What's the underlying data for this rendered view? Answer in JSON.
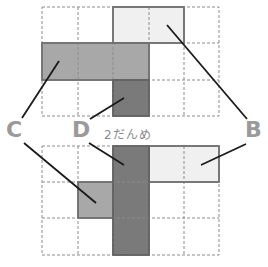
{
  "diagram": {
    "type": "grid-block-stacking-puzzle",
    "grid": {
      "columns": 5,
      "rows": 3
    },
    "colors": {
      "B": "#f0f0f0",
      "C": "#a8a8a8",
      "D": "#7a7a7a",
      "outline": "#707070",
      "grid_dash": "#8c8c8c",
      "label": "#9a9a9a",
      "leader": "#1a1a1a"
    },
    "top_grid": {
      "pieces": [
        {
          "id": "B",
          "cells": [
            [
              2,
              0
            ],
            [
              3,
              0
            ]
          ]
        },
        {
          "id": "C",
          "cells": [
            [
              0,
              1
            ],
            [
              1,
              1
            ],
            [
              2,
              1
            ]
          ]
        },
        {
          "id": "D",
          "cells": [
            [
              2,
              2
            ]
          ]
        }
      ]
    },
    "bottom_grid": {
      "caption": "2だんめ",
      "pieces": [
        {
          "id": "B",
          "cells": [
            [
              3,
              0
            ],
            [
              4,
              0
            ]
          ]
        },
        {
          "id": "C",
          "cells": [
            [
              1,
              1
            ]
          ]
        },
        {
          "id": "D",
          "cells": [
            [
              2,
              0
            ],
            [
              2,
              1
            ],
            [
              2,
              2
            ]
          ]
        }
      ]
    },
    "labels": {
      "C": "C",
      "D": "D",
      "B": "B"
    }
  }
}
